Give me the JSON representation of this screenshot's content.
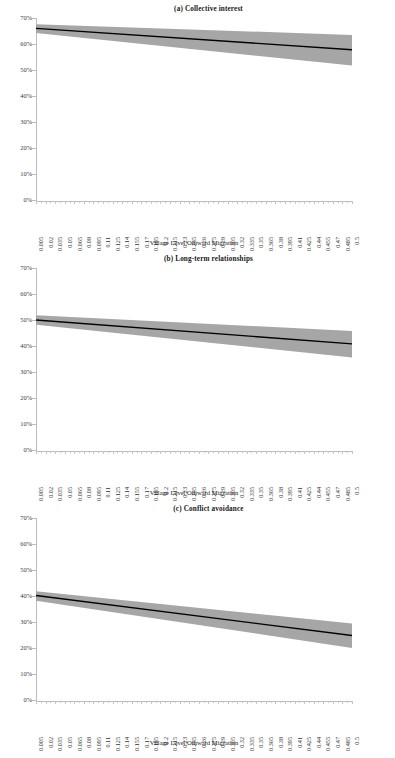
{
  "figure": {
    "x_axis_title": "Village Level Outward Migration",
    "y_tick_labels": [
      "70%",
      "60%",
      "50%",
      "40%",
      "30%",
      "20%",
      "10%",
      "0%"
    ],
    "x_tick_labels": [
      "0.005",
      "0.02",
      "0.035",
      "0.05",
      "0.065",
      "0.08",
      "0.095",
      "0.11",
      "0.125",
      "0.14",
      "0.155",
      "0.17",
      "0.185",
      "0.2",
      "0.215",
      "0.23",
      "0.245",
      "0.26",
      "0.275",
      "0.29",
      "0.305",
      "0.32",
      "0.335",
      "0.35",
      "0.365",
      "0.38",
      "0.395",
      "0.41",
      "0.425",
      "0.44",
      "0.455",
      "0.47",
      "0.485",
      "0.5"
    ],
    "colors": {
      "line": "#000000",
      "band": "#a6a6a6",
      "axis": "#bdbdbd",
      "text": "#231f20"
    },
    "panels": [
      {
        "title": "(a) Collective interest"
      },
      {
        "title": "(b) Long-term relationships"
      },
      {
        "title": "(c) Conflict avoidance"
      }
    ]
  },
  "chart_data": [
    {
      "type": "line",
      "title": "(a) Collective interest",
      "xlabel": "Village Level Outward Migration",
      "ylabel": "",
      "xlim": [
        0.005,
        0.5
      ],
      "ylim": [
        0,
        70
      ],
      "y_unit": "percent",
      "yticks": [
        0,
        10,
        20,
        30,
        40,
        50,
        60,
        70
      ],
      "grid": false,
      "legend": "none",
      "x": [
        0.005,
        0.5
      ],
      "series": [
        {
          "name": "Predicted probability",
          "values": [
            66.0,
            57.8
          ]
        },
        {
          "name": "95% CI upper",
          "values": [
            67.6,
            63.5
          ]
        },
        {
          "name": "95% CI lower",
          "values": [
            64.2,
            51.7
          ]
        }
      ]
    },
    {
      "type": "line",
      "title": "(b) Long-term relationships",
      "xlabel": "Village Level Outward Migration",
      "ylabel": "",
      "xlim": [
        0.005,
        0.5
      ],
      "ylim": [
        0,
        70
      ],
      "y_unit": "percent",
      "yticks": [
        0,
        10,
        20,
        30,
        40,
        50,
        60,
        70
      ],
      "grid": false,
      "legend": "none",
      "x": [
        0.005,
        0.5
      ],
      "series": [
        {
          "name": "Predicted probability",
          "values": [
            50.0,
            40.8
          ]
        },
        {
          "name": "95% CI upper",
          "values": [
            51.8,
            45.8
          ]
        },
        {
          "name": "95% CI lower",
          "values": [
            48.2,
            35.6
          ]
        }
      ]
    },
    {
      "type": "line",
      "title": "(c) Conflict avoidance",
      "xlabel": "Village Level Outward Migration",
      "ylabel": "",
      "xlim": [
        0.005,
        0.5
      ],
      "ylim": [
        0,
        70
      ],
      "y_unit": "percent",
      "yticks": [
        0,
        10,
        20,
        30,
        40,
        50,
        60,
        70
      ],
      "grid": false,
      "legend": "none",
      "x": [
        0.005,
        0.5
      ],
      "series": [
        {
          "name": "Predicted probability",
          "values": [
            40.2,
            24.8
          ]
        },
        {
          "name": "95% CI upper",
          "values": [
            41.8,
            29.4
          ]
        },
        {
          "name": "95% CI lower",
          "values": [
            38.2,
            20.0
          ]
        }
      ]
    }
  ]
}
